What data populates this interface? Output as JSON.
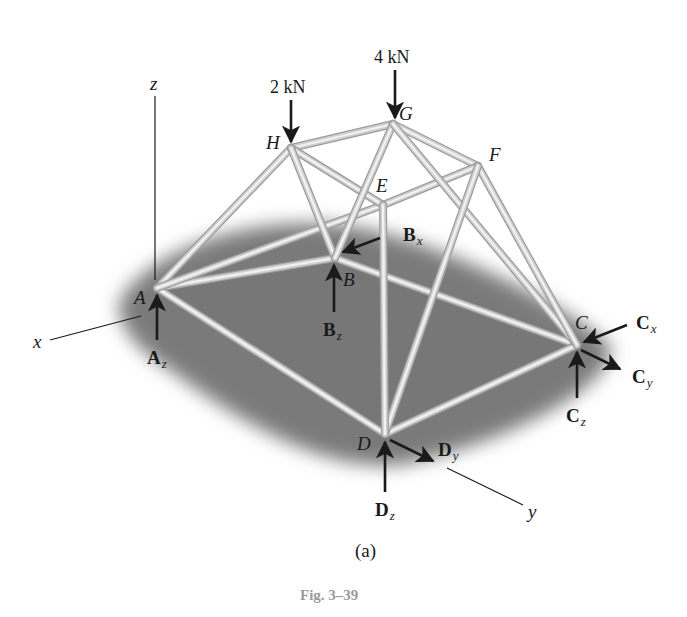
{
  "figure": {
    "caption": "Fig. 3–39",
    "sublabel": "(a)",
    "colors": {
      "background": "#ffffff",
      "shadow": "#7a7a7a",
      "member_light": "#f2f2f2",
      "member_dark": "#9c9c9c",
      "ink": "#1a1a1a",
      "caption": "#9a9a9a"
    }
  },
  "axes": {
    "x": {
      "label": "x"
    },
    "y": {
      "label": "y"
    },
    "z": {
      "label": "z"
    }
  },
  "nodes": {
    "A": {
      "label": "A",
      "pos": [
        157,
        288
      ]
    },
    "B": {
      "label": "B",
      "pos": [
        335,
        258
      ]
    },
    "C": {
      "label": "C",
      "pos": [
        577,
        345
      ]
    },
    "D": {
      "label": "D",
      "pos": [
        385,
        434
      ]
    },
    "E": {
      "label": "E",
      "pos": [
        383,
        205
      ]
    },
    "F": {
      "label": "F",
      "pos": [
        478,
        166
      ]
    },
    "G": {
      "label": "G",
      "pos": [
        393,
        124
      ]
    },
    "H": {
      "label": "H",
      "pos": [
        291,
        148
      ]
    }
  },
  "members": [
    [
      "A",
      "B"
    ],
    [
      "B",
      "C"
    ],
    [
      "C",
      "D"
    ],
    [
      "D",
      "A"
    ],
    [
      "A",
      "H"
    ],
    [
      "A",
      "E"
    ],
    [
      "H",
      "G"
    ],
    [
      "G",
      "F"
    ],
    [
      "F",
      "E"
    ],
    [
      "E",
      "H"
    ],
    [
      "H",
      "B"
    ],
    [
      "G",
      "B"
    ],
    [
      "G",
      "C"
    ],
    [
      "F",
      "C"
    ],
    [
      "F",
      "D"
    ],
    [
      "E",
      "D"
    ]
  ],
  "loads": [
    {
      "id": "load-H",
      "label": "2 kN",
      "node": "H"
    },
    {
      "id": "load-G",
      "label": "4 kN",
      "node": "G"
    }
  ],
  "reactions": {
    "Az": {
      "symbol": "A",
      "sub": "z"
    },
    "Bx": {
      "symbol": "B",
      "sub": "x"
    },
    "Bz": {
      "symbol": "B",
      "sub": "z"
    },
    "Cx": {
      "symbol": "C",
      "sub": "x"
    },
    "Cy": {
      "symbol": "C",
      "sub": "y"
    },
    "Cz": {
      "symbol": "C",
      "sub": "z"
    },
    "Dy": {
      "symbol": "D",
      "sub": "y"
    },
    "Dz": {
      "symbol": "D",
      "sub": "z"
    }
  }
}
